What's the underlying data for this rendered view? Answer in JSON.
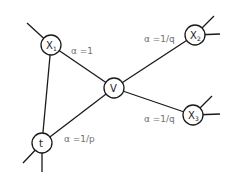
{
  "diagram": {
    "nodes": {
      "x1": {
        "label": "X",
        "sub": "1"
      },
      "v": {
        "label": "V",
        "sub": ""
      },
      "x2": {
        "label": "X",
        "sub": "2"
      },
      "x3": {
        "label": "X",
        "sub": "3"
      },
      "t": {
        "label": "t",
        "sub": ""
      }
    },
    "edges": [
      {
        "from": "t",
        "to": "x1"
      },
      {
        "from": "x1",
        "to": "v"
      },
      {
        "from": "t",
        "to": "v"
      },
      {
        "from": "v",
        "to": "x2"
      },
      {
        "from": "v",
        "to": "x3"
      }
    ],
    "edge_labels": {
      "x1_v": "α =1",
      "v_x2": "α =1/q",
      "t_v": "α =1/p",
      "v_x3": "α =1/q"
    }
  }
}
